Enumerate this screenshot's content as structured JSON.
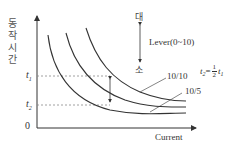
{
  "diagram": {
    "type": "inverse-time relay characteristic curves",
    "y_axis_label": "동작시간",
    "x_axis_label": "Current",
    "origin_label": "0",
    "t1_label": "t",
    "t1_sub": "1",
    "t2_label": "t",
    "t2_sub": "2",
    "lever_top_label": "대",
    "lever_bottom_label": "소",
    "lever_label": "Lever(0~10)",
    "curve_labels": [
      "10/10",
      "10/5"
    ],
    "formula": {
      "lhs": "t",
      "lhs_sub": "2",
      "eq": "=",
      "num": "1",
      "den": "2",
      "rhs": "t",
      "rhs_sub": "1"
    },
    "colors": {
      "line": "#333333",
      "dashed": "#888888",
      "text": "#444444"
    }
  }
}
